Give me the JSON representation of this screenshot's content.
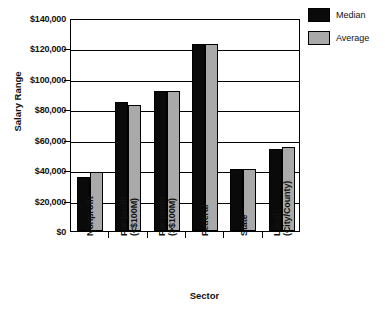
{
  "chart_data": {
    "type": "bar",
    "title": "",
    "xlabel": "Sector",
    "ylabel": "Salary Range",
    "categories": [
      "Nonprofit",
      "For-profit\n(<$100M)",
      "For-profit\n(>$100M)",
      "Federal",
      "State",
      "Local\n(City/County)"
    ],
    "series": [
      {
        "name": "Median",
        "color": "#0a0a0a",
        "values": [
          35500,
          84500,
          92000,
          123000,
          40500,
          54000
        ]
      },
      {
        "name": "Average",
        "color": "#a9a9a9",
        "values": [
          39000,
          83000,
          92000,
          123000,
          40500,
          55000
        ]
      }
    ],
    "ylim": [
      0,
      140000
    ],
    "ytick_values": [
      0,
      20000,
      40000,
      60000,
      80000,
      100000,
      120000,
      140000
    ],
    "ytick_labels": [
      "$0",
      "$20,000",
      "$40,000",
      "$60,000",
      "$80,000",
      "$100,000",
      "$120,000",
      "$140,000"
    ],
    "grid": true,
    "legend_position": "upper-right-outside"
  },
  "legend": {
    "entries": [
      {
        "label": "Median",
        "swatch": "median-swatch"
      },
      {
        "label": "Average",
        "swatch": "average-swatch"
      }
    ]
  }
}
